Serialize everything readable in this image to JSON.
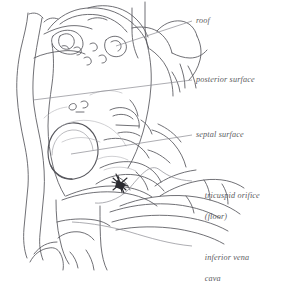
{
  "figure": {
    "style": "pen-and-ink anatomical sketch",
    "background_color": "#ffffff",
    "ink_color": "#55555a",
    "leader_line_color": "#8a8a90",
    "accent_mark_color": "#2b2b30"
  },
  "labels": [
    {
      "id": "roof",
      "lines": [
        "roof"
      ],
      "x": 196,
      "y": 16,
      "leader": {
        "from_x": 192,
        "from_y": 21,
        "to_x": 116,
        "to_y": 46
      }
    },
    {
      "id": "posterior-surface",
      "lines": [
        "posterior surface"
      ],
      "x": 196,
      "y": 75,
      "leader": {
        "from_x": 192,
        "from_y": 80,
        "to_x": 33,
        "to_y": 100
      }
    },
    {
      "id": "septal-surface",
      "lines": [
        "septal surface"
      ],
      "x": 196,
      "y": 130,
      "leader": {
        "from_x": 192,
        "from_y": 135,
        "to_x": 71,
        "to_y": 154
      }
    },
    {
      "id": "tricuspid-orifice",
      "lines": [
        "tricuspid orifice",
        "(floor)"
      ],
      "x": 196,
      "y": 180,
      "leader": {
        "from_x": 192,
        "from_y": 181,
        "to_x": 95,
        "to_y": 203
      }
    },
    {
      "id": "inferior-vena-cava",
      "lines": [
        "inferior vena",
        "cava"
      ],
      "x": 196,
      "y": 242,
      "leader": {
        "from_x": 192,
        "from_y": 246,
        "to_x": 72,
        "to_y": 222
      }
    }
  ],
  "annotations": {
    "fossa_ovalis_oval": "large oval depression on septal surface",
    "star_mark": "dark burst mark at tricuspid orifice",
    "vessel_left": "vertical vessel outlines at left margin"
  }
}
